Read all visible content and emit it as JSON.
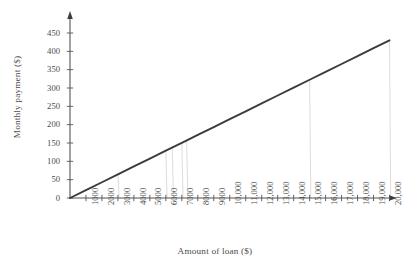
{
  "chart_data": {
    "type": "line",
    "title": "",
    "subtitle": "",
    "xlabel": "Amount of loan ($)",
    "ylabel": "Monthly payment ($)",
    "xlim": [
      0,
      20000
    ],
    "ylim": [
      0,
      450
    ],
    "grid": false,
    "legend": null,
    "legend_position": "none",
    "x_tick_labels": [
      "1000",
      "2000",
      "3000",
      "4000",
      "5000",
      "6000",
      "7000",
      "8000",
      "9000",
      "10,000",
      "11,000",
      "12,000",
      "13,000",
      "14,000",
      "15,000",
      "16,000",
      "17,000",
      "18,000",
      "19,000",
      "20,000"
    ],
    "x_tick_values": [
      1000,
      2000,
      3000,
      4000,
      5000,
      6000,
      7000,
      8000,
      9000,
      10000,
      11000,
      12000,
      13000,
      14000,
      15000,
      16000,
      17000,
      18000,
      19000,
      20000
    ],
    "y_tick_labels": [
      "0",
      "50",
      "100",
      "150",
      "200",
      "250",
      "300",
      "350",
      "400",
      "450"
    ],
    "y_tick_values": [
      0,
      50,
      100,
      150,
      200,
      250,
      300,
      350,
      400,
      450
    ],
    "series": [
      {
        "name": "monthly payment",
        "color": "#3b3b3b",
        "x": [
          0,
          20000
        ],
        "values": [
          0,
          430
        ],
        "points": [
          {
            "x": 0,
            "y": 0
          },
          {
            "x": 1000,
            "y": 21.5
          },
          {
            "x": 2000,
            "y": 43
          },
          {
            "x": 3000,
            "y": 64.5
          },
          {
            "x": 4000,
            "y": 86
          },
          {
            "x": 5000,
            "y": 107.5
          },
          {
            "x": 6000,
            "y": 129
          },
          {
            "x": 7000,
            "y": 150.5
          },
          {
            "x": 8000,
            "y": 172
          },
          {
            "x": 9000,
            "y": 193.5
          },
          {
            "x": 10000,
            "y": 215
          },
          {
            "x": 11000,
            "y": 236.5
          },
          {
            "x": 12000,
            "y": 258
          },
          {
            "x": 13000,
            "y": 279.5
          },
          {
            "x": 14000,
            "y": 301
          },
          {
            "x": 15000,
            "y": 322.5
          },
          {
            "x": 16000,
            "y": 344
          },
          {
            "x": 17000,
            "y": 365.5
          },
          {
            "x": 18000,
            "y": 387
          },
          {
            "x": 19000,
            "y": 408.5
          },
          {
            "x": 20000,
            "y": 430
          }
        ]
      }
    ],
    "annotations": []
  },
  "style": {
    "axis_color": "#555555",
    "line_color": "#3b3b3b",
    "text_color": "#4a4a4a",
    "background": "#ffffff",
    "artifact_color": "#d8d8d8"
  },
  "artifacts": {
    "description": "faint vertical scan lines",
    "x_positions": [
      3000,
      6000,
      6400,
      7000,
      7300,
      15000,
      20000
    ]
  }
}
